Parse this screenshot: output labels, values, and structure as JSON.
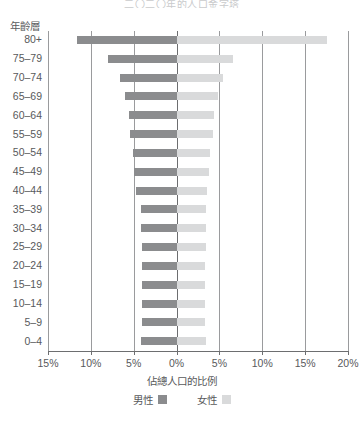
{
  "chart_data": {
    "type": "bar",
    "subtype": "population-pyramid",
    "title": "二〇二〇年的人口金字塔",
    "xlabel": "佔總人口的比例",
    "ylabel": "年齡層",
    "grid": true,
    "legend_position": "bottom",
    "axis_unit": "%",
    "xlim": [
      -15,
      20
    ],
    "xticks": [
      -15,
      -10,
      -5,
      0,
      5,
      10,
      15,
      20
    ],
    "xtick_labels": [
      "15%",
      "10%",
      "5%",
      "0%",
      "5%",
      "10%",
      "15%",
      "20%"
    ],
    "categories": [
      "80+",
      "75–79",
      "70–74",
      "65–69",
      "60–64",
      "55–59",
      "50–54",
      "45–49",
      "40–44",
      "35–39",
      "30–34",
      "25–29",
      "20–24",
      "15–19",
      "10–14",
      "5–9",
      "0–4"
    ],
    "series": [
      {
        "name": "男性",
        "color": "#8b8c8e",
        "side": "left",
        "values": [
          11.6,
          8.0,
          6.6,
          6.0,
          5.6,
          5.4,
          5.1,
          5.0,
          4.7,
          4.2,
          4.1,
          4.0,
          4.0,
          4.0,
          4.0,
          4.0,
          4.1
        ]
      },
      {
        "name": "女性",
        "color": "#d9dadb",
        "side": "right",
        "values": [
          17.5,
          6.6,
          5.4,
          4.8,
          4.4,
          4.2,
          3.9,
          3.8,
          3.6,
          3.4,
          3.4,
          3.4,
          3.3,
          3.3,
          3.3,
          3.3,
          3.4
        ]
      }
    ]
  },
  "legend": {
    "items": [
      {
        "label": "男性",
        "color": "#8b8c8e"
      },
      {
        "label": "女性",
        "color": "#d9dadb"
      }
    ]
  }
}
